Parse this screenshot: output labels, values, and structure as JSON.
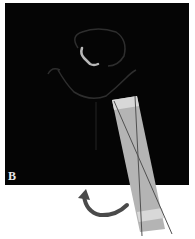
{
  "figure": {
    "panel_label": "B",
    "background_color": "#050505",
    "page_color": "#ffffff",
    "probe": {
      "fill_color": "#b4b4b4",
      "band_color": "#d8d8d8",
      "line_color": "#505050"
    },
    "arrow": {
      "color": "#4a4a4a",
      "semantic": "rotation-arrow"
    },
    "structures": {
      "outline_color": "#3a3a3a",
      "bright_structure_color": "#b8b8b8"
    }
  }
}
